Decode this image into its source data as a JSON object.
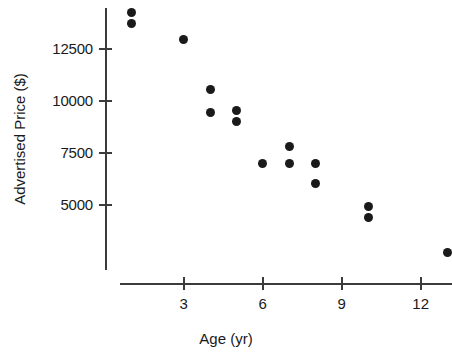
{
  "chart_data": {
    "type": "scatter",
    "title": "",
    "xlabel": "Age (yr)",
    "ylabel": "Advertised Price ($)",
    "xlim": [
      0,
      13.6
    ],
    "ylim": [
      1800,
      14800
    ],
    "xticks": [
      3,
      6,
      9,
      12
    ],
    "xtick_labels": [
      "3",
      "6",
      "9",
      "12"
    ],
    "yticks": [
      5000,
      7500,
      10000,
      12500
    ],
    "ytick_labels": [
      "5000",
      "7500",
      "10000",
      "12500"
    ],
    "grid": false,
    "legend": null,
    "marker": "filled-circle",
    "marker_color": "#1a1a1a",
    "points": [
      {
        "x": 1,
        "y": 14300
      },
      {
        "x": 1,
        "y": 13750
      },
      {
        "x": 3,
        "y": 12950
      },
      {
        "x": 4,
        "y": 10550
      },
      {
        "x": 4,
        "y": 9450
      },
      {
        "x": 5,
        "y": 9550
      },
      {
        "x": 5,
        "y": 9000
      },
      {
        "x": 6,
        "y": 7000
      },
      {
        "x": 7,
        "y": 7800
      },
      {
        "x": 7,
        "y": 7000
      },
      {
        "x": 8,
        "y": 7000
      },
      {
        "x": 8,
        "y": 6000
      },
      {
        "x": 10,
        "y": 4900
      },
      {
        "x": 10,
        "y": 4400
      },
      {
        "x": 13,
        "y": 2700
      }
    ]
  },
  "axes": {
    "x_axis_name": "age-axis",
    "y_axis_name": "price-axis"
  }
}
